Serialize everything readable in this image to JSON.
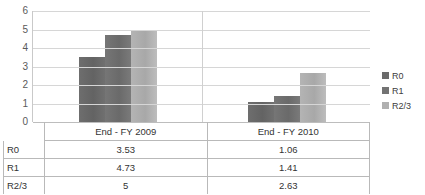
{
  "chart_data": {
    "type": "bar",
    "title": "",
    "xlabel": "",
    "ylabel": "",
    "categories": [
      "End - FY 2009",
      "End - FY 2010"
    ],
    "series": [
      {
        "name": "R0",
        "values": [
          3.53,
          1.06
        ],
        "color": "#6b6b6b"
      },
      {
        "name": "R1",
        "values": [
          4.73,
          1.41
        ],
        "color": "#737373"
      },
      {
        "name": "R2/3",
        "values": [
          5,
          2.63
        ],
        "color": "#b0b0b0"
      }
    ],
    "ylim": [
      0,
      6
    ],
    "yticks": [
      6,
      5,
      4,
      3,
      2,
      1,
      0
    ],
    "ytick_labels": [
      "6",
      "5",
      "4",
      "3",
      "2",
      "1",
      "0"
    ],
    "grid": true,
    "legend_position": "right",
    "legend_entries": [
      "R0",
      "R1",
      "R2/3"
    ]
  },
  "table": {
    "header": {
      "corner": "",
      "cells": [
        "End - FY 2009",
        "End - FY 2010"
      ]
    },
    "rows": [
      {
        "label": "R0",
        "cells": [
          "3.53",
          "1.06"
        ]
      },
      {
        "label": "R1",
        "cells": [
          "4.73",
          "1.41"
        ]
      },
      {
        "label": "R2/3",
        "cells": [
          "5",
          "2.63"
        ]
      }
    ]
  }
}
